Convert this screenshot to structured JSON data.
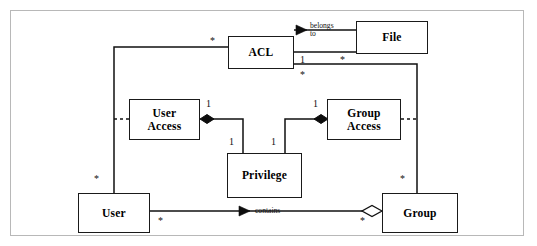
{
  "diagram": {
    "kind": "uml-class-diagram",
    "frame": {
      "stroke": "#b8b8b8"
    },
    "style": {
      "box_stroke": "#1a1a1a",
      "line_stroke": "#111111",
      "background": "#ffffff"
    },
    "classes": [
      {
        "id": "acl",
        "name": "ACL",
        "lines": [
          "ACL"
        ],
        "x": 228,
        "y": 36,
        "w": 66,
        "h": 33
      },
      {
        "id": "file",
        "name": "File",
        "lines": [
          "File"
        ],
        "x": 356,
        "y": 21,
        "w": 72,
        "h": 33
      },
      {
        "id": "user-access",
        "name": "User Access",
        "lines": [
          "User",
          "Access"
        ],
        "x": 129,
        "y": 99,
        "w": 71,
        "h": 41
      },
      {
        "id": "group-access",
        "name": "Group Access",
        "lines": [
          "Group",
          "Access"
        ],
        "x": 327,
        "y": 99,
        "w": 74,
        "h": 41
      },
      {
        "id": "privilege",
        "name": "Privilege",
        "lines": [
          "Privilege"
        ],
        "x": 227,
        "y": 153,
        "w": 75,
        "h": 45
      },
      {
        "id": "user",
        "name": "User",
        "lines": [
          "User"
        ],
        "x": 78,
        "y": 193,
        "w": 72,
        "h": 40
      },
      {
        "id": "group",
        "name": "Group",
        "lines": [
          "Group"
        ],
        "x": 382,
        "y": 193,
        "w": 76,
        "h": 40
      }
    ],
    "associations": [
      {
        "id": "acl-belongs-to-file",
        "label": "belongs to",
        "label_lines": [
          "belongs",
          "to"
        ],
        "from": "file",
        "to": "acl",
        "arrow": "filled-triangle",
        "arrow_direction": "left",
        "multiplicity_near_acl": "1",
        "multiplicity_near_file": "*"
      },
      {
        "id": "user-contains-group",
        "label": "contains",
        "label_lines": [
          "contains"
        ],
        "from": "group",
        "to": "user",
        "arrow": "filled-triangle",
        "arrow_direction": "left",
        "diamond": "hollow",
        "diamond_at": "group",
        "multiplicity_near_user": "*",
        "multiplicity_near_group": "*"
      },
      {
        "id": "user-access-privilege",
        "from": "user-access",
        "to": "privilege",
        "diamond": "filled",
        "diamond_at": "user-access",
        "multiplicity_near_user_access": "1",
        "multiplicity_near_privilege": "1"
      },
      {
        "id": "group-access-privilege",
        "from": "group-access",
        "to": "privilege",
        "diamond": "filled",
        "diamond_at": "group-access",
        "multiplicity_near_group_access": "1",
        "multiplicity_near_privilege": "1"
      },
      {
        "id": "acl-user",
        "from": "acl",
        "to": "user",
        "multiplicity_near_acl": "*",
        "multiplicity_near_user": "*",
        "branches_to": "user-access"
      },
      {
        "id": "acl-group",
        "from": "acl",
        "to": "group",
        "multiplicity_near_acl": "*",
        "multiplicity_near_group": "*",
        "branches_to": "group-access"
      }
    ],
    "multiplicity_markers": [
      {
        "id": "m-acl-left",
        "text": "*",
        "x": 210,
        "y": 36
      },
      {
        "id": "m-acl-file-one",
        "text": "1",
        "x": 300,
        "y": 55
      },
      {
        "id": "m-file-left",
        "text": "*",
        "x": 340,
        "y": 55
      },
      {
        "id": "m-acl-bottom",
        "text": "*",
        "x": 300,
        "y": 70
      },
      {
        "id": "m-user-access-one",
        "text": "1",
        "x": 206,
        "y": 99
      },
      {
        "id": "m-group-access-one",
        "text": "1",
        "x": 313,
        "y": 99
      },
      {
        "id": "m-priv-left-one",
        "text": "1",
        "x": 229,
        "y": 137
      },
      {
        "id": "m-priv-right-one",
        "text": "1",
        "x": 271,
        "y": 137
      },
      {
        "id": "m-user-top",
        "text": "*",
        "x": 94,
        "y": 174
      },
      {
        "id": "m-group-top",
        "text": "*",
        "x": 400,
        "y": 174
      },
      {
        "id": "m-user-right",
        "text": "*",
        "x": 158,
        "y": 216
      },
      {
        "id": "m-group-left",
        "text": "*",
        "x": 360,
        "y": 216
      }
    ],
    "edge_labels": [
      {
        "id": "lbl-belongs-to",
        "lines": [
          "belongs",
          "to"
        ],
        "x": 310,
        "y": 22
      },
      {
        "id": "lbl-contains",
        "lines": [
          "contains"
        ],
        "x": 255,
        "y": 214
      }
    ]
  }
}
